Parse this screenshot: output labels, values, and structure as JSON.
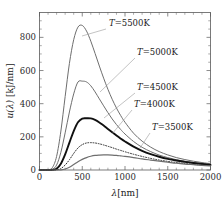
{
  "chart_data": {
    "type": "line",
    "title": "",
    "xlabel": "λ[nm]",
    "ylabel": "u(λ) [kJ/nm]",
    "xlim": [
      0,
      2000
    ],
    "ylim": [
      0,
      950
    ],
    "xticks": [
      0,
      500,
      1000,
      1500,
      2000
    ],
    "yticks": [
      0,
      200,
      400,
      600,
      800
    ],
    "xtick_labels": [
      "0",
      "500",
      "1000",
      "1500",
      "2000"
    ],
    "ytick_labels": [
      "0",
      "200",
      "400",
      "600",
      "800"
    ],
    "grid": false,
    "legend_position": "inline-annotations",
    "series": [
      {
        "name": "T=5500K",
        "temperature_K": 5500,
        "style": "solid-thin-gray",
        "color": "#6e6e6e",
        "width": 1.0,
        "peak": {
          "x": 527,
          "y": 872
        },
        "x": [
          0,
          50,
          100,
          150,
          200,
          250,
          300,
          350,
          400,
          450,
          500,
          550,
          600,
          650,
          700,
          750,
          800,
          850,
          900,
          950,
          1000,
          1100,
          1200,
          1300,
          1400,
          1500,
          1600,
          1700,
          1800,
          1900,
          2000
        ],
        "y": [
          0,
          0,
          1,
          14,
          82,
          235,
          443,
          643,
          786,
          862,
          872,
          838,
          777,
          703,
          627,
          554,
          487,
          427,
          374,
          328,
          288,
          222,
          174,
          138,
          111,
          91,
          75,
          63,
          53,
          45,
          38
        ]
      },
      {
        "name": "T=5000K",
        "temperature_K": 5000,
        "style": "solid-thin-gray",
        "color": "#6e6e6e",
        "width": 1.0,
        "peak": {
          "x": 580,
          "y": 536
        },
        "x": [
          0,
          50,
          100,
          150,
          200,
          250,
          300,
          350,
          400,
          450,
          500,
          550,
          600,
          650,
          700,
          750,
          800,
          850,
          900,
          950,
          1000,
          1100,
          1200,
          1300,
          1400,
          1500,
          1600,
          1700,
          1800,
          1900,
          2000
        ],
        "y": [
          0,
          0,
          0,
          4,
          30,
          107,
          224,
          350,
          459,
          531,
          536,
          531,
          508,
          471,
          429,
          387,
          346,
          308,
          274,
          244,
          217,
          172,
          137,
          111,
          90,
          75,
          62,
          53,
          45,
          38,
          33
        ]
      },
      {
        "name": "T=4500K",
        "temperature_K": 4500,
        "style": "solid-thick-black",
        "color": "#101010",
        "width": 1.9,
        "peak": {
          "x": 644,
          "y": 312
        },
        "x": [
          0,
          50,
          100,
          150,
          200,
          250,
          300,
          350,
          400,
          450,
          500,
          550,
          600,
          650,
          700,
          750,
          800,
          850,
          900,
          950,
          1000,
          1100,
          1200,
          1300,
          1400,
          1500,
          1600,
          1700,
          1800,
          1900,
          2000
        ],
        "y": [
          0,
          0,
          0,
          1,
          8,
          38,
          94,
          165,
          235,
          288,
          310,
          312,
          311,
          302,
          287,
          268,
          248,
          228,
          208,
          189,
          172,
          141,
          116,
          96,
          80,
          67,
          57,
          49,
          42,
          36,
          31
        ]
      },
      {
        "name": "T=4000K",
        "temperature_K": 4000,
        "style": "dotted-black",
        "color": "#2a2a2a",
        "width": 1.0,
        "peak": {
          "x": 725,
          "y": 165
        },
        "x": [
          0,
          50,
          100,
          150,
          200,
          250,
          300,
          350,
          400,
          450,
          500,
          550,
          600,
          650,
          700,
          750,
          800,
          850,
          900,
          950,
          1000,
          1100,
          1200,
          1300,
          1400,
          1500,
          1600,
          1700,
          1800,
          1900,
          2000
        ],
        "y": [
          0,
          0,
          0,
          0,
          1,
          9,
          30,
          62,
          100,
          133,
          153,
          163,
          165,
          163,
          158,
          151,
          143,
          135,
          126,
          118,
          110,
          95,
          82,
          70,
          60,
          52,
          45,
          39,
          34,
          30,
          26
        ]
      },
      {
        "name": "T=3500K",
        "temperature_K": 3500,
        "style": "solid-thin-gray",
        "color": "#6e6e6e",
        "width": 1.2,
        "peak": {
          "x": 828,
          "y": 91
        },
        "x": [
          0,
          50,
          100,
          150,
          200,
          250,
          300,
          350,
          400,
          450,
          500,
          550,
          600,
          650,
          700,
          750,
          800,
          850,
          900,
          950,
          1000,
          1100,
          1200,
          1300,
          1400,
          1500,
          1600,
          1700,
          1800,
          1900,
          2000
        ],
        "y": [
          0,
          0,
          0,
          0,
          0,
          1,
          6,
          17,
          33,
          50,
          64,
          75,
          83,
          88,
          90,
          91,
          91,
          90,
          88,
          85,
          82,
          75,
          67,
          60,
          53,
          47,
          41,
          36,
          32,
          28,
          25
        ]
      }
    ],
    "annotations": [
      {
        "label": "T=5500K",
        "symbol": "T",
        "value": "=5500K",
        "x_px": 109,
        "y_px": 26,
        "leader_from": [
          106,
          29
        ],
        "leader_to": [
          82,
          36
        ]
      },
      {
        "label": "T=5000K",
        "symbol": "T",
        "value": "=5000K",
        "x_px": 137,
        "y_px": 55,
        "leader_from": [
          135,
          58
        ],
        "leader_to": [
          100,
          92
        ]
      },
      {
        "label": "T=4500K",
        "symbol": "T",
        "value": "=4500K",
        "x_px": 137,
        "y_px": 90,
        "leader_from": [
          135,
          93
        ],
        "leader_to": [
          104,
          118
        ]
      },
      {
        "label": "T=4000K",
        "symbol": "T",
        "value": "=4000K",
        "x_px": 134,
        "y_px": 107,
        "leader_from": [
          132,
          110
        ],
        "leader_to": [
          112,
          134
        ]
      },
      {
        "label": "T=3500K",
        "symbol": "T",
        "value": "=3500K",
        "x_px": 152,
        "y_px": 130,
        "leader_from": [
          150,
          133
        ],
        "leader_to": [
          140,
          148
        ]
      }
    ]
  },
  "axes": {
    "x_title_symbol": "λ",
    "x_title_unit": "[nm]",
    "y_title_symbol": "u(λ)",
    "y_title_unit": "[kJ/nm]"
  },
  "colors": {
    "frame": "#5a5a5a",
    "text": "#1a1a1a",
    "gray_curve": "#6e6e6e",
    "black_curve": "#101010",
    "leader": "#9a9a9a",
    "background": "#ffffff"
  }
}
